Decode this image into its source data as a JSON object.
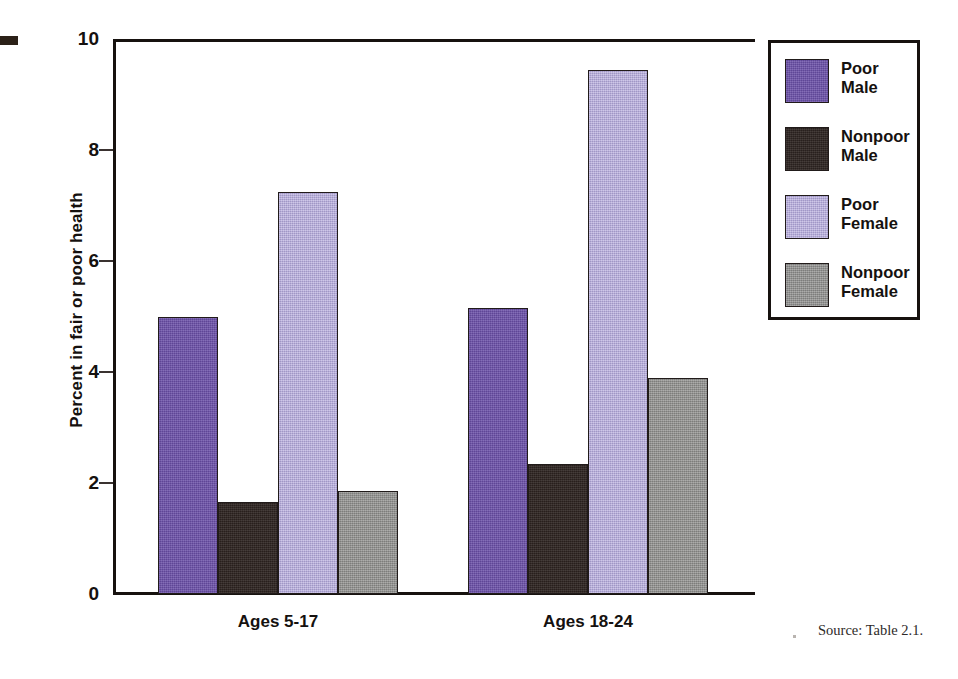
{
  "figure": {
    "source_note": "Source: Table 2.1.",
    "corner_mark": "corner-mark"
  },
  "legend": {
    "position": "right",
    "items": [
      {
        "label": "Poor\nMale",
        "color": "#6a4fa8",
        "key": "poor-male"
      },
      {
        "label": "Nonpoor\nMale",
        "color": "#2c2320",
        "key": "nonpoor-male"
      },
      {
        "label": "Poor\nFemale",
        "color": "#b2a7dc",
        "key": "poor-female"
      },
      {
        "label": "Nonpoor\nFemale",
        "color": "#8e8e8c",
        "key": "nonpoor-female"
      }
    ]
  },
  "axis": {
    "y_title": "Percent in fair or poor health",
    "y_ticks": [
      "10",
      "8",
      "6",
      "4",
      "2",
      "0"
    ]
  },
  "chart_data": {
    "type": "bar",
    "title": "",
    "subtitle": "",
    "xlabel": "",
    "ylabel": "Percent in fair or poor health",
    "ylim": [
      0,
      10
    ],
    "ytick_values": [
      10,
      8,
      6,
      4,
      2,
      0
    ],
    "grid": false,
    "legend_position": "right",
    "categories": [
      "Ages 5-17",
      "Ages 18-24"
    ],
    "series": [
      {
        "name": "Poor Male",
        "color": "#6a4fa8",
        "values": [
          5.0,
          5.15
        ]
      },
      {
        "name": "Nonpoor Male",
        "color": "#2c2320",
        "values": [
          1.65,
          2.35
        ]
      },
      {
        "name": "Poor Female",
        "color": "#b2a7dc",
        "values": [
          7.25,
          9.45
        ]
      },
      {
        "name": "Nonpoor Female",
        "color": "#8e8e8c",
        "values": [
          1.85,
          3.9
        ]
      }
    ],
    "annotations": [
      "Source: Table 2.1."
    ]
  }
}
